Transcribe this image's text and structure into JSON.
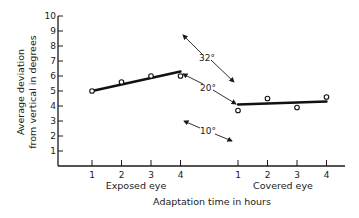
{
  "chart_data": {
    "type": "line",
    "title": "",
    "xlabel": "Adaptation time in hours",
    "ylabel": "Average deviation from vertical in degrees",
    "ylabel_lines": [
      "Average deviation",
      "from vertical in degrees"
    ],
    "ylim": [
      0,
      10
    ],
    "yticks": [
      1,
      2,
      3,
      4,
      5,
      6,
      7,
      8,
      9,
      10
    ],
    "grid": false,
    "legend": "none",
    "groups": [
      {
        "name": "Exposed eye",
        "x": [
          1,
          2,
          3,
          4
        ],
        "points": [
          5.0,
          5.6,
          6.0,
          6.0
        ],
        "fit_line": [
          5.0,
          6.3
        ]
      },
      {
        "name": "Covered eye",
        "x": [
          1,
          2,
          3,
          4
        ],
        "points": [
          3.7,
          4.5,
          3.9,
          4.6
        ],
        "fit_line": [
          4.1,
          4.3
        ]
      }
    ],
    "annotations": [
      {
        "text": "32°",
        "direction": "diagonal"
      },
      {
        "text": "20°",
        "direction": "diagonal"
      },
      {
        "text": "10°",
        "direction": "diagonal"
      }
    ]
  }
}
